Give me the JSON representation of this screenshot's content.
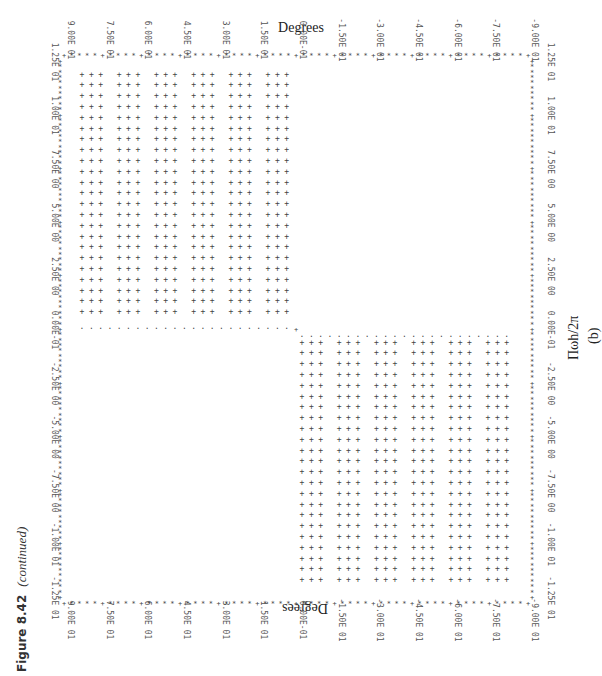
{
  "figure": {
    "label": "Figure 8.42",
    "continued": "(continued)",
    "subfigure": "(b)",
    "top_axis_title": "Degrees",
    "bottom_axis_title": "Degrees",
    "freq_axis_title": "Πωh/2π"
  },
  "chart_data": {
    "type": "line",
    "title": "",
    "xlabel": "Πωh/2π",
    "ylabel": "Degrees",
    "orientation": "rotated 90 degrees (line-printer output)",
    "x_ticks": [
      "-1.25E 01",
      "-1.00E 01",
      "-7.50E 00",
      "-5.00E 00",
      "-2.50E 00",
      "0.00E-01",
      "2.50E 00",
      "5.00E 00",
      "7.50E 00",
      "1.00E 01",
      "1.25E 01"
    ],
    "y_ticks": [
      "9.00E 01",
      "7.50E 01",
      "6.00E 01",
      "4.50E 01",
      "3.00E 01",
      "1.50E 01",
      "0.00E-01",
      "-1.50E 01",
      "-3.00E 01",
      "-4.50E 01",
      "-6.00E 01",
      "-7.50E 01",
      "-9.00E 01"
    ],
    "xlim": [
      -12.5,
      12.5
    ],
    "ylim": [
      -90,
      90
    ],
    "grid": false,
    "series": [
      {
        "name": "Phase",
        "x": [
          -12.5,
          -0.01,
          0.01,
          12.5
        ],
        "y": [
          90,
          90,
          -90,
          -90
        ]
      }
    ],
    "annotations": [
      "Phase is +90 for negative frequency, -90 for positive frequency (filled region printed with + marks)"
    ]
  }
}
